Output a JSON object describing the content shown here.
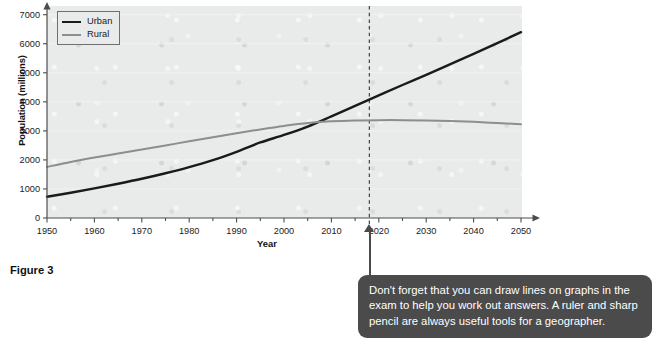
{
  "figure": {
    "caption": "Figure 3"
  },
  "legend": {
    "position": "top-left",
    "items": [
      {
        "label": "Urban",
        "color": "#1a1a1a"
      },
      {
        "label": "Rural",
        "color": "#8d8d8d"
      }
    ]
  },
  "callout": {
    "text": "Don't forget that you can draw lines on graphs in the exam to help you work out answers. A ruler and sharp pencil are always useful tools for a geographer.",
    "background": "#4b4b4b",
    "text_color": "#ffffff"
  },
  "chart_data": {
    "type": "line",
    "title": "",
    "xlabel": "Year",
    "ylabel": "Population (millions)",
    "xlim": [
      1950,
      2050
    ],
    "ylim": [
      0,
      7000
    ],
    "xticks": [
      1950,
      1960,
      1970,
      1980,
      1990,
      2000,
      2010,
      2020,
      2030,
      2040,
      2050
    ],
    "xtick_labels": [
      "1950",
      "1960",
      "1970",
      "1980",
      "1990",
      "2000",
      "2010",
      "2020",
      "2030",
      "2040",
      "2050"
    ],
    "minor_xticks": [
      1955,
      1965,
      1975,
      1985,
      1995,
      2005,
      2015,
      2025,
      2035,
      2045
    ],
    "yticks": [
      0,
      1000,
      2000,
      3000,
      4000,
      5000,
      6000,
      7000
    ],
    "ytick_labels": [
      "0",
      "1000",
      "2000",
      "3000",
      "4000",
      "5000",
      "6000",
      "7000"
    ],
    "grid": true,
    "plot_background": "#e9eaea",
    "x": [
      1950,
      1955,
      1960,
      1965,
      1970,
      1975,
      1980,
      1985,
      1990,
      1995,
      2000,
      2005,
      2010,
      2015,
      2020,
      2025,
      2030,
      2035,
      2040,
      2045,
      2050
    ],
    "series": [
      {
        "name": "Urban",
        "color": "#1a1a1a",
        "values": [
          730,
          870,
          1020,
          1180,
          1350,
          1540,
          1750,
          1990,
          2280,
          2600,
          2860,
          3150,
          3500,
          3860,
          4220,
          4580,
          4930,
          5290,
          5650,
          6020,
          6400
        ]
      },
      {
        "name": "Rural",
        "color": "#8d8d8d",
        "values": [
          1760,
          1930,
          2080,
          2220,
          2360,
          2500,
          2640,
          2780,
          2920,
          3050,
          3170,
          3270,
          3330,
          3360,
          3370,
          3370,
          3360,
          3340,
          3310,
          3270,
          3230
        ]
      }
    ],
    "annotations": [
      {
        "type": "vline",
        "x": 2018,
        "style": "dashed",
        "color": "#333333",
        "label": ""
      }
    ],
    "crossover": {
      "year": 2008,
      "value": 3340
    }
  }
}
